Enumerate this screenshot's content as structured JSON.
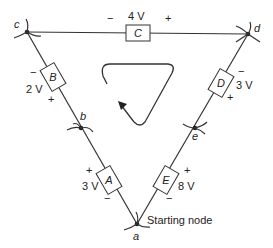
{
  "diagram": {
    "type": "circuit-loop",
    "nodes": [
      {
        "id": "a",
        "label": "a",
        "x": 137,
        "y": 224
      },
      {
        "id": "b",
        "label": "b",
        "x": 81,
        "y": 128
      },
      {
        "id": "c",
        "label": "c",
        "x": 27,
        "y": 32
      },
      {
        "id": "d",
        "label": "d",
        "x": 248,
        "y": 34
      },
      {
        "id": "e",
        "label": "e",
        "x": 195,
        "y": 128
      }
    ],
    "elements": [
      {
        "id": "A",
        "label": "A",
        "voltage": "3 V",
        "plus": "+",
        "minus": "−"
      },
      {
        "id": "B",
        "label": "B",
        "voltage": "2 V",
        "plus": "+",
        "minus": "−"
      },
      {
        "id": "C",
        "label": "C",
        "voltage": "4 V",
        "plus": "+",
        "minus": "−"
      },
      {
        "id": "D",
        "label": "D",
        "voltage": "3 V",
        "plus": "+",
        "minus": "−"
      },
      {
        "id": "E",
        "label": "E",
        "voltage": "8 V",
        "plus": "+",
        "minus": "−"
      }
    ],
    "starting_node_label": "Starting node",
    "loop_direction": "clockwise"
  }
}
